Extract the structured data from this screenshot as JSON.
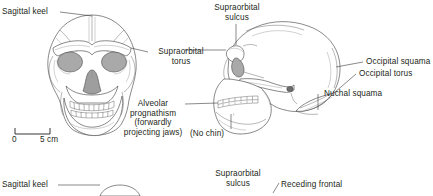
{
  "figure": {
    "caption_present": false,
    "views": [
      {
        "name": "frontal-skull",
        "description": "Homo erectus cranium, frontal view"
      },
      {
        "name": "lateral-skull",
        "description": "Homo erectus cranium, lateral view"
      }
    ]
  },
  "labels": {
    "sagittal_keel": "Sagittal keel",
    "supraorbital_torus_line1": "Supraorbital",
    "supraorbital_torus_line2": "torus",
    "supraorbital_sulcus_line1": "Supraorbital",
    "supraorbital_sulcus_line2": "sulcus",
    "alveolar_prognathism_line1": "Alveolar",
    "alveolar_prognathism_line2": "prognathism",
    "alveolar_prognathism_line3": "(forwardly",
    "alveolar_prognathism_line4": "projecting jaws)",
    "no_chin": "(No chin)",
    "occipital_squama": "Occipital squama",
    "occipital_torus": "Occipital torus",
    "nuchal_squama": "Nuchal squama"
  },
  "scale_bar": {
    "start_label": "0",
    "end_label": "5 cm",
    "unit": "cm",
    "length_value": 5
  },
  "next_figure": {
    "sagittal_keel": "Sagittal keel",
    "supraorbital_sulcus_line1": "Supraorbital",
    "supraorbital_sulcus_line2": "sulcus",
    "receding_frontal": "Receding frontal"
  },
  "colors": {
    "background": "#ffffff",
    "ink": "#231f20",
    "outline": "#4a4a4a",
    "orbit_fill": "#a9a9a9",
    "leader_line": "#3a3a3a"
  }
}
